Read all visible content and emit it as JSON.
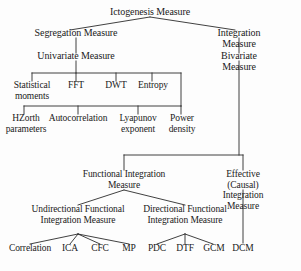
{
  "figure": {
    "type": "hierarchy-tree",
    "orientation": "top-down",
    "line_color": "#2b2b2b",
    "background_color": "#fdfdfd",
    "text_color": "#1a1a1a"
  },
  "nodes": {
    "root": "Ictogenesis Measure",
    "segregation": "Segregation Measure",
    "integration": "Integration Measure",
    "univariate": "Univariate Measure",
    "bivariate": "Bivariate Measure",
    "statistical_moments": "Statistical\nmoments",
    "fft": "FFT",
    "dwt": "DWT",
    "entropy": "Entropy",
    "hzorth": "HZorth\nparameters",
    "autocorrelation": "Autocorrelation",
    "lyapunov": "Lyapunov\nexponent",
    "power_density": "Power\ndensity",
    "functional_integration": "Functional Integration\nMeasure",
    "effective_causal": "Effective (Causal)\nIntegration Measure",
    "undirectional": "Undirectional Functional\nIntegration Measure",
    "directional": "Directional Functional\nIntegration Measure",
    "correlation": "Correlation",
    "ica": "ICA",
    "cfc": "CFC",
    "mp": "MP",
    "pdc": "PDC",
    "dtf": "DTF",
    "gcm": "GCM",
    "dcm": "DCM"
  }
}
